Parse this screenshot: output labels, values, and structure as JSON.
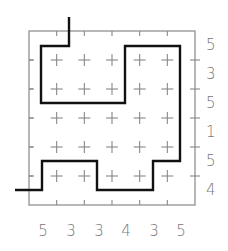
{
  "puzzle": {
    "rows": 6,
    "cols": 6,
    "row_clues": [
      "5",
      "3",
      "5",
      "1",
      "5",
      "4"
    ],
    "col_clues": [
      "5",
      "3",
      "3",
      "4",
      "3",
      "5"
    ],
    "grid_color": "#888888",
    "path_color": "#111111",
    "clue_color": "#777777",
    "path_points": [
      [
        69,
        17
      ],
      [
        69,
        46
      ],
      [
        41,
        46
      ],
      [
        41,
        103
      ],
      [
        125,
        103
      ],
      [
        125,
        46
      ],
      [
        180,
        46
      ],
      [
        180,
        161
      ],
      [
        153,
        161
      ],
      [
        153,
        190
      ],
      [
        97,
        190
      ],
      [
        97,
        161
      ],
      [
        42,
        161
      ],
      [
        42,
        190
      ],
      [
        15,
        190
      ]
    ]
  }
}
